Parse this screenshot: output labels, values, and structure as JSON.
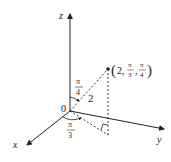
{
  "diagram": {
    "type": "spherical-coordinates",
    "axes": {
      "x_label": "x",
      "y_label": "y",
      "z_label": "z"
    },
    "origin_label": "0",
    "rho_label": "2",
    "phi_label": {
      "num": "π",
      "den": "4"
    },
    "theta_label": {
      "num": "π",
      "den": "3"
    },
    "point_label": {
      "open": "(",
      "rho": "2,",
      "theta_num": "π",
      "theta_den": "3",
      "comma": ",",
      "phi_num": "π",
      "phi_den": "4",
      "close": ")"
    },
    "colors": {
      "ink": "#222222",
      "background": "#ffffff"
    }
  }
}
